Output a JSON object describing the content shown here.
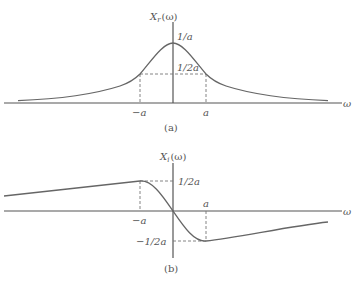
{
  "figure_a": {
    "title": "X_r(ω)",
    "title_main": "X",
    "title_sub": "r",
    "title_arg": "(ω)",
    "peak_label": "1/a",
    "half_label": "1/2a",
    "neg_a_label": "−a",
    "pos_a_label": "a",
    "x_axis_label": "ω",
    "caption": "(a)"
  },
  "figure_b": {
    "title": "X_i(ω)",
    "title_main": "X",
    "title_sub": "i",
    "title_arg": "(ω)",
    "pos_half_label": "1/2a",
    "neg_half_label": "−1/2a",
    "neg_a_label": "−a",
    "pos_a_label": "a",
    "x_axis_label": "ω",
    "caption": "(b)"
  },
  "colors": {
    "curve": "#666666",
    "axis": "#555555",
    "dashed": "#777777"
  }
}
